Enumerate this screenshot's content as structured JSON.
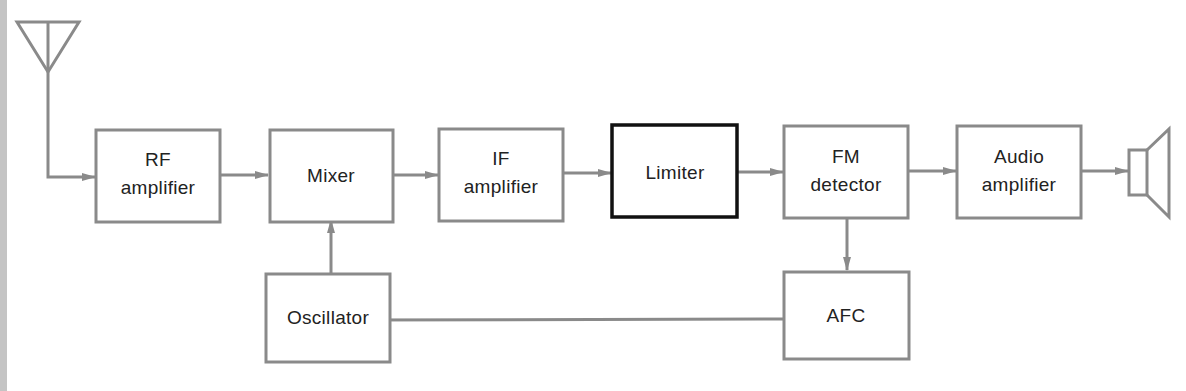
{
  "diagram": {
    "type": "block-diagram",
    "colors": {
      "box_stroke": "#8a8a8a",
      "highlight_stroke": "#111111",
      "text": "#222222",
      "background": "#ffffff"
    },
    "blocks": {
      "rf_amplifier": {
        "line1": "RF",
        "line2": "amplifier"
      },
      "mixer": {
        "line1": "Mixer"
      },
      "if_amplifier": {
        "line1": "IF",
        "line2": "amplifier"
      },
      "limiter": {
        "line1": "Limiter",
        "highlighted": true
      },
      "fm_detector": {
        "line1": "FM",
        "line2": "detector"
      },
      "audio_amplifier": {
        "line1": "Audio",
        "line2": "amplifier"
      },
      "oscillator": {
        "line1": "Oscillator"
      },
      "afc": {
        "line1": "AFC"
      }
    },
    "icons": {
      "input": "antenna-icon",
      "output": "speaker-icon"
    },
    "connections": [
      [
        "antenna",
        "rf_amplifier"
      ],
      [
        "rf_amplifier",
        "mixer"
      ],
      [
        "mixer",
        "if_amplifier"
      ],
      [
        "if_amplifier",
        "limiter"
      ],
      [
        "limiter",
        "fm_detector"
      ],
      [
        "fm_detector",
        "audio_amplifier"
      ],
      [
        "audio_amplifier",
        "speaker"
      ],
      [
        "fm_detector",
        "afc"
      ],
      [
        "afc",
        "oscillator"
      ],
      [
        "oscillator",
        "mixer"
      ]
    ]
  }
}
